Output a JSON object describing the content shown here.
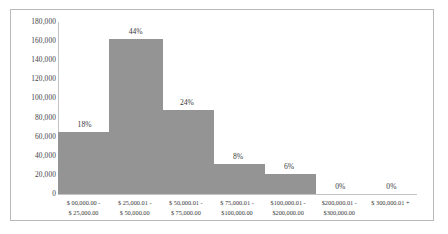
{
  "chart_data": {
    "type": "bar",
    "title": "",
    "xlabel": "",
    "ylabel": "",
    "ylim": [
      0,
      180000
    ],
    "grid": false,
    "legend": "none",
    "categories": [
      "$ 00,000.00 - $ 25,000.00",
      "$ 25,000.01 - $ 50,000.00",
      "$ 50,000.01 - $ 75,000.00",
      "$ 75,000.01 - $100,000.00",
      "$100,000.01 - $200,000.00",
      "$200,000.01 - $300,000.00",
      "$ 300,000.01 +"
    ],
    "category_lines": [
      [
        "$ 00,000.00 -",
        "$ 25,000.00"
      ],
      [
        "$ 25,000.01 -",
        "$ 50,000.00"
      ],
      [
        "$ 50,000.01 -",
        "$ 75,000.00"
      ],
      [
        "$ 75,000.01 -",
        "$100,000.00"
      ],
      [
        "$100,000.01 -",
        "$200,000.00"
      ],
      [
        "$200,000.01 -",
        "$300,000.00"
      ],
      [
        "$ 300,000.01 +",
        ""
      ]
    ],
    "values": [
      65000,
      162000,
      88000,
      31000,
      21000,
      0,
      0
    ],
    "data_labels": [
      "18%",
      "44%",
      "24%",
      "8%",
      "6%",
      "0%",
      "0%"
    ],
    "ytick_labels": [
      "180,000",
      "160,000",
      "140,000",
      "120,000",
      "100,000",
      "80,000",
      "60,000",
      "40,000",
      "20,000",
      "0"
    ],
    "ytick_values": [
      180000,
      160000,
      140000,
      120000,
      100000,
      80000,
      60000,
      40000,
      20000,
      0
    ],
    "bar_color": "#949494",
    "axis_color": "#c3c3c3",
    "border_color": "#b9b9b9",
    "background_color": "#ffffff"
  }
}
